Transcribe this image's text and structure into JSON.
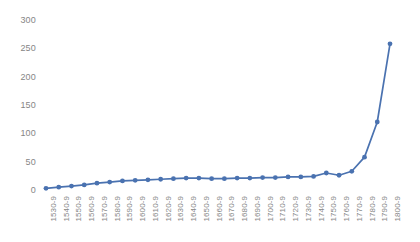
{
  "chart_data": {
    "type": "line",
    "title": "",
    "subtitle": "",
    "xlabel": "",
    "ylabel": "",
    "categories": [
      "1530-9",
      "1540-9",
      "1550-9",
      "1560-9",
      "1570-9",
      "1580-9",
      "1590-9",
      "1600-9",
      "1610-9",
      "1620-9",
      "1630-9",
      "1640-9",
      "1650-9",
      "1660-9",
      "1670-9",
      "1680-9",
      "1690-9",
      "1700-9",
      "1710-9",
      "1720-9",
      "1730-9",
      "1740-9",
      "1750-9",
      "1760-9",
      "1770-9",
      "1780-9",
      "1790-9",
      "1800-9"
    ],
    "values": [
      3,
      5,
      7,
      9,
      12,
      14,
      16,
      17,
      18,
      19,
      20,
      21,
      21,
      20,
      20,
      21,
      21,
      22,
      22,
      23,
      23,
      24,
      30,
      26,
      33,
      58,
      120,
      258
    ],
    "series": [
      {
        "name": "Series 1",
        "color": "#4A72B0",
        "marker": "circle",
        "values": [
          3,
          5,
          7,
          9,
          12,
          14,
          16,
          17,
          18,
          19,
          20,
          21,
          21,
          20,
          20,
          21,
          21,
          22,
          22,
          23,
          23,
          24,
          30,
          26,
          33,
          58,
          120,
          258
        ]
      }
    ],
    "y_ticks": [
      0,
      50,
      100,
      150,
      200,
      250,
      300
    ],
    "ylim": [
      0,
      300
    ],
    "xlim_index": [
      0,
      27
    ],
    "grid": false,
    "legend": false,
    "legend_position": "none",
    "axis_line": false,
    "tick_label_rotation_deg": -90,
    "background_color": "#FFFFFF",
    "tick_label_color": "#868686"
  }
}
